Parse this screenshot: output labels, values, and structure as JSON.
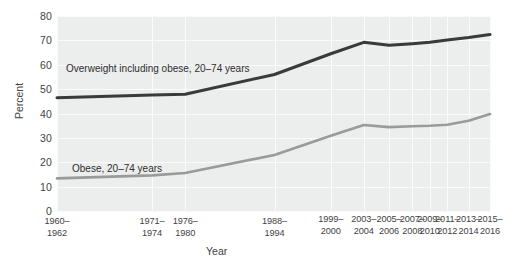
{
  "chart_data": {
    "type": "line",
    "title": "",
    "xlabel": "Year",
    "ylabel": "Percent",
    "ylim": [
      0,
      80
    ],
    "ytick_step": 10,
    "grid": true,
    "legend_position": "inline-annotation",
    "categories": [
      "1960–1962",
      "1971–1974",
      "1976–1980",
      "1988–1994",
      "1999–2000",
      "2003–2004",
      "2005–2006",
      "2007–2008",
      "2009–2010",
      "2011–2012",
      "2013–2014",
      "2015–2016"
    ],
    "yticks": [
      "0",
      "10",
      "20",
      "30",
      "40",
      "50",
      "60",
      "70",
      "80"
    ],
    "series": [
      {
        "name": "Overweight including obese, 20–74 years",
        "color": "#3a3a3a",
        "values": [
          46.5,
          47.6,
          47.9,
          56.0,
          64.5,
          69.2,
          68.0,
          68.6,
          69.2,
          70.2,
          71.2,
          72.4
        ]
      },
      {
        "name": "Obese, 20–74 years",
        "color": "#9a9a9a",
        "values": [
          13.4,
          14.6,
          15.6,
          23.0,
          30.9,
          35.3,
          34.4,
          34.8,
          35.0,
          35.4,
          37.0,
          39.8
        ]
      }
    ],
    "annotations": [
      {
        "text_line1": "Overweight including obese,",
        "text_line2": "20–74 years"
      },
      {
        "text_line1": "Obese, 20–74 years",
        "text_line2": ""
      }
    ]
  },
  "colors": {
    "plot_background": "#eceded",
    "gridline": "#fbfbfb",
    "page_background": "#ffffff",
    "text": "#3f3f3f",
    "series_overweight": "#3a3a3a",
    "series_obese": "#9a9a9a"
  }
}
